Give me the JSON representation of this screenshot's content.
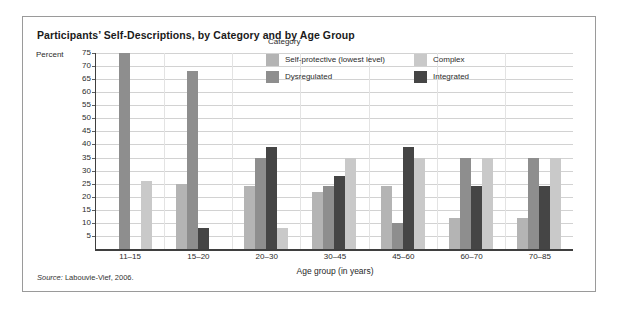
{
  "figure": {
    "title": "Participants’ Self-Descriptions, by Category and by Age Group",
    "percent_label": "Percent",
    "source_prefix": "Source:",
    "source_text": "Labouvie-Vief, 2006.",
    "frame_color": "#9a9a9a",
    "background": "#ffffff"
  },
  "legend": {
    "title": "Category",
    "items": [
      {
        "label": "Self-protective (lowest level)",
        "color": "#b4b4b4"
      },
      {
        "label": "Complex",
        "color": "#c9c9c9"
      },
      {
        "label": "Dysregulated",
        "color": "#8e8e8e"
      },
      {
        "label": "Integrated",
        "color": "#454545"
      }
    ]
  },
  "chart_data": {
    "type": "bar",
    "title": "Participants’ Self-Descriptions, by Category and by Age Group",
    "subtitle": "",
    "xlabel": "Age group (in years)",
    "ylabel": "Percent",
    "ylim": [
      0,
      75
    ],
    "yticks": [
      75,
      70,
      65,
      60,
      55,
      50,
      45,
      40,
      35,
      30,
      25,
      20,
      15,
      10,
      5
    ],
    "grid": true,
    "legend_position": "inside-top-right",
    "legend_title": "Category",
    "categories": [
      "11–15",
      "15–20",
      "20–30",
      "30–45",
      "45–60",
      "60–70",
      "70–85"
    ],
    "series": [
      {
        "name": "Self-protective (lowest level)",
        "color": "#b4b4b4",
        "values": [
          0,
          25,
          24,
          22,
          24,
          12,
          12
        ]
      },
      {
        "name": "Dysregulated",
        "color": "#8e8e8e",
        "values": [
          75,
          68,
          35,
          24,
          10,
          35,
          35
        ]
      },
      {
        "name": "Integrated",
        "color": "#454545",
        "values": [
          0,
          8,
          39,
          28,
          39,
          24,
          24
        ]
      },
      {
        "name": "Complex",
        "color": "#c9c9c9",
        "values": [
          26,
          0,
          8,
          35,
          35,
          35,
          35
        ]
      }
    ],
    "series_draw_order": [
      "Self-protective (lowest level)",
      "Dysregulated",
      "Integrated",
      "Complex"
    ]
  }
}
